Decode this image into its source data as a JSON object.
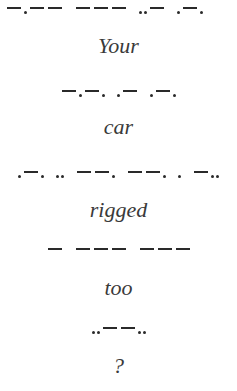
{
  "lines": [
    {
      "type": "morse",
      "letters": [
        "-.--",
        "---",
        "..-",
        ".-."
      ]
    },
    {
      "type": "word",
      "text": "Your"
    },
    {
      "type": "morse",
      "letters": [
        "-.-.",
        ".-",
        ".-."
      ]
    },
    {
      "type": "word",
      "text": "car"
    },
    {
      "type": "morse",
      "letters": [
        ".-.",
        "..",
        "--.",
        "--.",
        ".",
        "-.."
      ]
    },
    {
      "type": "word",
      "text": "rigged"
    },
    {
      "type": "morse",
      "letters": [
        "-",
        "---",
        "---"
      ]
    },
    {
      "type": "word",
      "text": "too"
    },
    {
      "type": "morse",
      "letters": [
        "..--.."
      ]
    },
    {
      "type": "word",
      "text": "?"
    }
  ],
  "words": {
    "w1": "Your",
    "w2": "car",
    "w3": "rigged",
    "w4": "too",
    "w5": "?"
  },
  "colors": {
    "background": "#ffffff",
    "ink": "#2a2a2a"
  }
}
